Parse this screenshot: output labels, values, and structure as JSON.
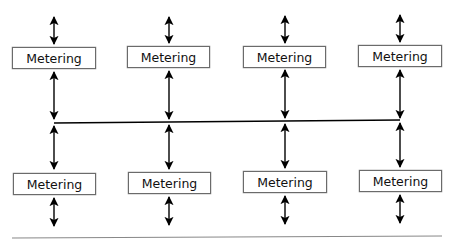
{
  "diagram": {
    "type": "metering-bus-topology",
    "top_row": [
      {
        "label": "Metering"
      },
      {
        "label": "Metering"
      },
      {
        "label": "Metering"
      },
      {
        "label": "Metering"
      }
    ],
    "bottom_row": [
      {
        "label": "Metering"
      },
      {
        "label": "Metering"
      },
      {
        "label": "Metering"
      },
      {
        "label": "Metering"
      }
    ],
    "connectors": {
      "top_external_arrows": 4,
      "bus_arrows_top": 4,
      "bus_arrows_bottom": 4,
      "bottom_external_arrows": 4,
      "bus_line": "horizontal shared bus",
      "baseline": "horizontal rule"
    },
    "colors": {
      "line": "#000000",
      "box_border": "#6b6b6b",
      "text": "#111111",
      "baseline": "#888888"
    }
  }
}
